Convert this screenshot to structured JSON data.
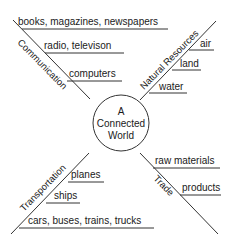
{
  "center": {
    "lines": [
      "A",
      "Connected",
      "World"
    ]
  },
  "branches": {
    "communication": {
      "label": "Communication",
      "items": [
        "books, magazines, newspapers",
        "radio, televison",
        "computers"
      ]
    },
    "natural_resources": {
      "label": "Natural Resources",
      "items": [
        "air",
        "land",
        "water"
      ]
    },
    "transportation": {
      "label": "Transportation",
      "items": [
        "planes",
        "ships",
        "cars, buses, trains, trucks"
      ]
    },
    "trade": {
      "label": "Trade",
      "items": [
        "raw materials",
        "products"
      ]
    }
  },
  "colors": {
    "line": "#333333",
    "text": "#1a1a1a",
    "background": "#ffffff"
  }
}
